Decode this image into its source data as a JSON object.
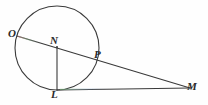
{
  "figure": {
    "background_color": "#fefefe",
    "stroke_color": "#3a3a3a",
    "label_color": "#2a2a2a",
    "width": 208,
    "height": 105
  },
  "circle": {
    "name": "main-circle",
    "center_x": 57,
    "center_y": 48,
    "radius": 42,
    "stroke_color": "#3a3a3a",
    "stroke_width": 1.1,
    "fill": "none"
  },
  "points": [
    {
      "id": "O",
      "label": "O",
      "x": 18,
      "y": 36,
      "position": "on-circle-left"
    },
    {
      "id": "N",
      "label": "N",
      "x": 57,
      "y": 47,
      "position": "interior-intersection"
    },
    {
      "id": "P",
      "label": "P",
      "x": 95,
      "y": 62,
      "position": "on-circle-right"
    },
    {
      "id": "L",
      "label": "L",
      "x": 57,
      "y": 90,
      "position": "on-circle-bottom"
    },
    {
      "id": "M",
      "label": "M",
      "x": 188,
      "y": 88,
      "position": "external-right"
    }
  ],
  "segments": [
    {
      "id": "OM",
      "name": "secant-o-to-m",
      "from": "O",
      "to": "M",
      "x1": 17,
      "y1": 36,
      "x2": 190,
      "y2": 88,
      "stroke_width": 1.1
    },
    {
      "id": "NL",
      "name": "chord-n-to-l",
      "from": "N",
      "to": "L",
      "x1": 57,
      "y1": 47,
      "x2": 57,
      "y2": 90,
      "stroke_width": 1.1
    },
    {
      "id": "LM",
      "name": "segment-l-to-m",
      "from": "L",
      "to": "M",
      "x1": 57,
      "y1": 90,
      "x2": 190,
      "y2": 88,
      "stroke_width": 1.1
    }
  ],
  "labels": {
    "O": "O",
    "N": "N",
    "P": "P",
    "L": "L",
    "M": "M"
  }
}
